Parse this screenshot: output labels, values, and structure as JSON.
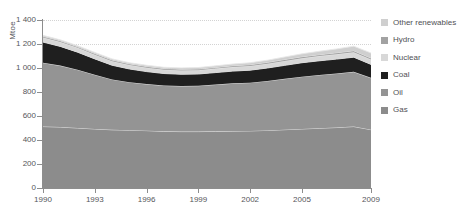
{
  "chart_data": {
    "type": "area",
    "stacked": true,
    "title": "",
    "xlabel": "",
    "ylabel": "Mtoe",
    "ylim": [
      0,
      1400
    ],
    "ytick_step": 200,
    "yticks": [
      "0",
      "200",
      "400",
      "600",
      "800",
      "1 000",
      "1 200",
      "1 400"
    ],
    "ytick_values": [
      0,
      200,
      400,
      600,
      800,
      1000,
      1200,
      1400
    ],
    "xlim": [
      1990,
      2009
    ],
    "xticks": [
      "1990",
      "1993",
      "1996",
      "1999",
      "2002",
      "2005",
      "2009"
    ],
    "xtick_values": [
      1990,
      1993,
      1996,
      1999,
      2002,
      2005,
      2009
    ],
    "grid": true,
    "grid_style": "dotted-horizontal",
    "legend_position": "right",
    "x": [
      1990,
      1991,
      1992,
      1993,
      1994,
      1995,
      1996,
      1997,
      1998,
      1999,
      2000,
      2001,
      2002,
      2003,
      2004,
      2005,
      2006,
      2007,
      2008,
      2009
    ],
    "series": [
      {
        "name": "Gas",
        "color": "#8c8c8c",
        "values": [
          512,
          508,
          500,
          492,
          485,
          482,
          478,
          472,
          470,
          470,
          472,
          474,
          476,
          480,
          486,
          492,
          498,
          504,
          512,
          486
        ]
      },
      {
        "name": "Oil",
        "color": "#949494",
        "values": [
          532,
          512,
          486,
          452,
          420,
          400,
          388,
          382,
          380,
          382,
          390,
          398,
          402,
          412,
          424,
          436,
          444,
          450,
          456,
          432
        ]
      },
      {
        "name": "Coal",
        "color": "#1f1f1f",
        "values": [
          172,
          160,
          146,
          132,
          118,
          110,
          104,
          100,
          98,
          98,
          100,
          102,
          104,
          108,
          112,
          116,
          118,
          120,
          122,
          112
        ]
      },
      {
        "name": "Nuclear",
        "color": "#d8d8d8",
        "values": [
          38,
          37,
          36,
          35,
          34,
          33,
          33,
          32,
          32,
          32,
          33,
          34,
          35,
          36,
          37,
          38,
          39,
          40,
          41,
          40
        ]
      },
      {
        "name": "Hydro",
        "color": "#a2a2a2",
        "values": [
          10,
          10,
          10,
          10,
          10,
          10,
          10,
          10,
          10,
          10,
          10,
          11,
          11,
          11,
          12,
          12,
          12,
          13,
          13,
          13
        ]
      },
      {
        "name": "Other renewables",
        "color": "#cfcfcf",
        "values": [
          8,
          8,
          8,
          9,
          9,
          9,
          10,
          10,
          11,
          12,
          13,
          14,
          16,
          18,
          21,
          24,
          28,
          32,
          38,
          42
        ]
      }
    ],
    "stack_order_bottom_to_top": [
      "Gas",
      "Oil",
      "Coal",
      "Nuclear",
      "Hydro",
      "Other renewables"
    ],
    "totals": [
      1272,
      1235,
      1186,
      1130,
      1076,
      1044,
      1023,
      1006,
      1001,
      1004,
      1018,
      1033,
      1044,
      1065,
      1092,
      1118,
      1139,
      1159,
      1182,
      1125
    ]
  },
  "legend": {
    "items": [
      {
        "label": "Other renewables",
        "color": "#cfcfcf"
      },
      {
        "label": "Hydro",
        "color": "#a2a2a2"
      },
      {
        "label": "Nuclear",
        "color": "#d8d8d8"
      },
      {
        "label": "Coal",
        "color": "#1f1f1f"
      },
      {
        "label": "Oil",
        "color": "#949494"
      },
      {
        "label": "Gas",
        "color": "#8c8c8c"
      }
    ]
  },
  "colors": {
    "axis": "#8d8d8d",
    "grid": "#d3d3d3",
    "text": "#55565a",
    "background": "#ffffff",
    "separator": "#e8e8e8"
  }
}
